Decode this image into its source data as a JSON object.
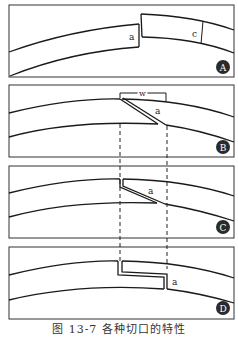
{
  "figure": {
    "caption": "图 13-7  各种切口的特性",
    "panels": [
      {
        "id": "A",
        "badge": "A",
        "labels": {
          "a": "a",
          "c": "c"
        }
      },
      {
        "id": "B",
        "badge": "B",
        "labels": {
          "w": "w",
          "a": "a"
        }
      },
      {
        "id": "C",
        "badge": "C",
        "labels": {
          "a": "a"
        }
      },
      {
        "id": "D",
        "badge": "D",
        "labels": {
          "a": "a"
        }
      }
    ]
  },
  "colors": {
    "line": "#1a1a1a",
    "frame": "#333333",
    "badge_fill": "#2b2b2b",
    "badge_text": "#ffffff"
  }
}
